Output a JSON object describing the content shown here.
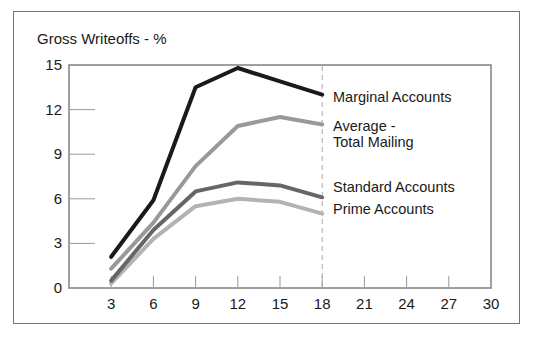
{
  "title": "Gross Writeoffs - %",
  "chart_data": {
    "type": "line",
    "title": "Gross Writeoffs - %",
    "xlabel": "",
    "ylabel": "Gross Writeoffs - %",
    "x": [
      3,
      6,
      9,
      12,
      15,
      18
    ],
    "series": [
      {
        "name": "marginal-accounts",
        "label": "Marginal Accounts",
        "color": "#1a1a1a",
        "values": [
          2.1,
          5.9,
          13.5,
          14.8,
          13.9,
          13.0
        ]
      },
      {
        "name": "average-total-mailing",
        "label": "Average -\nTotal Mailing",
        "color": "#999999",
        "values": [
          1.3,
          4.4,
          8.2,
          10.9,
          11.5,
          11.0
        ]
      },
      {
        "name": "standard-accounts",
        "label": "Standard Accounts",
        "color": "#666666",
        "values": [
          0.5,
          3.9,
          6.5,
          7.1,
          6.9,
          6.1
        ]
      },
      {
        "name": "prime-accounts",
        "label": "Prime Accounts",
        "color": "#b3b3b3",
        "values": [
          0.3,
          3.3,
          5.5,
          6.0,
          5.8,
          5.0
        ]
      }
    ],
    "xticks": [
      "3",
      "6",
      "9",
      "12",
      "15",
      "18",
      "21",
      "24",
      "27",
      "30"
    ],
    "xtick_values": [
      3,
      6,
      9,
      12,
      15,
      18,
      21,
      24,
      27,
      30
    ],
    "yticks": [
      "0",
      "3",
      "6",
      "9",
      "12",
      "15"
    ],
    "ytick_values": [
      0,
      3,
      6,
      9,
      12,
      15
    ],
    "xlim": [
      0,
      30
    ],
    "ylim": [
      0,
      15
    ],
    "dashed_vline_x": 18,
    "grid": false,
    "legend_position": "labels-right-of-line-ends",
    "colors": {
      "plot_border": "#808080",
      "tick": "#999999",
      "dashed_line": "#aaaaaa",
      "text": "#1a1a1a"
    }
  }
}
